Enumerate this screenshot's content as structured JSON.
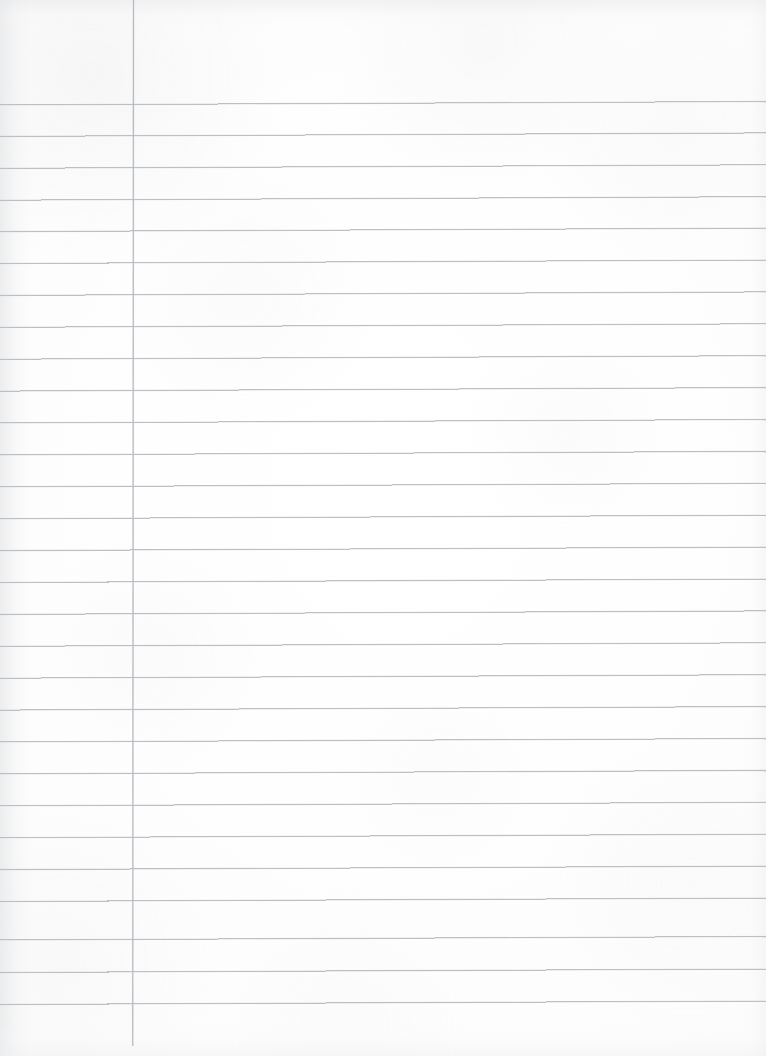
{
  "document": {
    "type": "scanned-lined-notebook-page",
    "title": "Blank Ruled Notebook Page",
    "page_width": 766,
    "page_height": 1056,
    "orientation": "portrait",
    "has_text_content": false,
    "visible_text": "",
    "paper_color": "#fdfdfd",
    "rule_color": "#b9bdc3",
    "margin_rule_color": "#b6babf",
    "background_color": "#ffffff"
  },
  "ruling": {
    "style": "wide-ruled-single-margin",
    "first_rule_y": 105,
    "rule_spacing": 31.9,
    "rule_count": 29,
    "rule_stroke_width": 1,
    "skew_rise_px": 3.5,
    "rules_start_x": 0,
    "rules_end_x": 766,
    "margin_line_x": 133.5,
    "margin_line_top_y": 0,
    "margin_line_bottom_y": 1046,
    "margin_line_stroke_width": 1.15,
    "header_blank_height": 105,
    "rule_y_positions": [
      105,
      136.4,
      168.3,
      200.2,
      231.6,
      263.5,
      295.4,
      327.3,
      359.2,
      391.1,
      423,
      454.9,
      486.8,
      518.7,
      550.6,
      582.5,
      614.4,
      646.3,
      678.2,
      710.1,
      742,
      773.9,
      805.8,
      837.7,
      869.6,
      901.5,
      940,
      972.5,
      1004.5
    ]
  },
  "regions": {
    "header_area_label": "header-blank-space",
    "margin_column_label": "left-margin-column",
    "body_area_label": "ruled-writing-body",
    "footer_area_label": "footer-blank-space"
  }
}
